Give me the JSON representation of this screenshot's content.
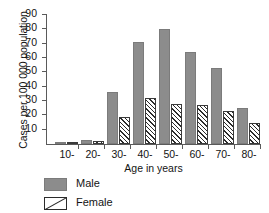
{
  "chart_data": {
    "type": "bar",
    "title": "",
    "subtitle": "",
    "xlabel": "Age in years",
    "ylabel": "Cases per 100 000 population",
    "categories": [
      "10-",
      "20-",
      "30-",
      "40-",
      "50-",
      "60-",
      "70-",
      "80-"
    ],
    "series": [
      {
        "name": "Male",
        "color": "#8c8c8c",
        "pattern": "solid-fill",
        "values": [
          1,
          3,
          36,
          71,
          80,
          64,
          53,
          25
        ]
      },
      {
        "name": "Female",
        "color": "#ffffff",
        "pattern": "diagonal-hatch",
        "values": [
          1,
          2,
          19,
          32,
          28,
          27,
          23,
          15
        ]
      }
    ],
    "ylim": [
      0,
      90
    ],
    "yticks": [
      10,
      20,
      30,
      40,
      50,
      60,
      70,
      80,
      90
    ],
    "ytick_labels": [
      "10",
      "20",
      "30",
      "40",
      "50",
      "60",
      "70",
      "80",
      "90"
    ],
    "grid": false,
    "legend_position": "below-left",
    "legend_entries": [
      "Male",
      "Female"
    ]
  },
  "axes": {
    "y_title": "Cases per 100 000 population",
    "x_title": "Age in years"
  },
  "legend": {
    "male_label": "Male",
    "female_label": "Female"
  }
}
